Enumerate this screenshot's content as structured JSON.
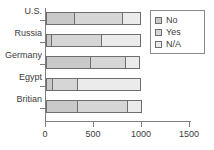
{
  "chart_data": {
    "type": "bar",
    "orientation": "horizontal",
    "stacked": true,
    "title": "",
    "xlabel": "",
    "ylabel": "",
    "categories": [
      "U.S.",
      "Russia",
      "Germany",
      "Egypt",
      "Britian"
    ],
    "series": [
      {
        "name": "No",
        "values": [
          300,
          60,
          470,
          70,
          335
        ]
      },
      {
        "name": "Yes",
        "values": [
          510,
          535,
          375,
          275,
          530
        ]
      },
      {
        "name": "N/A",
        "values": [
          200,
          415,
          155,
          665,
          155
        ]
      }
    ],
    "totals": [
      1010,
      1010,
      1000,
      1010,
      1020
    ],
    "xlim": [
      0,
      1500
    ],
    "xticks": [
      0,
      500,
      1000,
      1500
    ],
    "xtick_labels": [
      "0",
      "500",
      "1000",
      "1500"
    ],
    "grid": false,
    "legend_position": "top-right",
    "colors": {
      "No": "#c9c9c9",
      "Yes": "#d6d6d6",
      "N/A": "#ebebeb",
      "outline": "#6e6e6e",
      "axis": "#7d7d7d",
      "text": "#3c3c3c",
      "background": "#ffffff"
    }
  },
  "legend": {
    "items": [
      {
        "label": "No"
      },
      {
        "label": "Yes"
      },
      {
        "label": "N/A"
      }
    ]
  }
}
